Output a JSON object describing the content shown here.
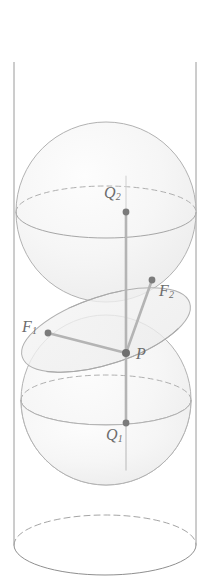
{
  "figure": {
    "type": "geometry-diagram",
    "width": 211,
    "height": 583,
    "background_color": "#ffffff",
    "stroke_color": "#9a9a9a",
    "sphere_fill": "#f4f4f4",
    "plane_fill": "#f0f0f0",
    "segment_color": "#a8a8a8",
    "point_color": "#7a7a7a",
    "label_color": "#6d6d6d"
  },
  "cylinder": {
    "left_x": 14,
    "right_x": 196,
    "top_ellipse": {
      "cx": 105,
      "cy": 62,
      "rx": 91,
      "ry": 32,
      "back_arc": "solid"
    },
    "bottom_ellipse": {
      "cx": 105,
      "cy": 545,
      "rx": 91,
      "ry": 30,
      "back_arc": "dashed"
    }
  },
  "spheres": [
    {
      "name": "upper-sphere",
      "cx": 106,
      "cy": 212,
      "r": 90,
      "equator": {
        "ry": 26,
        "back_arc": "dashed",
        "front_arc": "solid"
      }
    },
    {
      "name": "lower-sphere",
      "cx": 106,
      "cy": 400,
      "r": 85,
      "equator": {
        "ry": 25,
        "back_arc": "dashed",
        "front_arc": "solid"
      }
    }
  ],
  "cutting_plane": {
    "name": "tilted-plane-ellipse",
    "cx": 106,
    "cy": 330,
    "rx": 88,
    "ry": 34,
    "rotation_deg": -18
  },
  "points": [
    {
      "id": "Q2",
      "label": "Q",
      "sub": "2",
      "x": 126,
      "y": 212,
      "label_x": 104,
      "label_y": 184
    },
    {
      "id": "F2",
      "label": "F",
      "sub": "2",
      "x": 152,
      "y": 280,
      "label_x": 159,
      "label_y": 282
    },
    {
      "id": "F1",
      "label": "F",
      "sub": "1",
      "x": 48,
      "y": 333,
      "label_x": 22,
      "label_y": 318
    },
    {
      "id": "P",
      "label": "P",
      "sub": "",
      "x": 126,
      "y": 353,
      "label_x": 136,
      "label_y": 351
    },
    {
      "id": "Q1",
      "label": "Q",
      "sub": "1",
      "x": 126,
      "y": 423,
      "label_x": 106,
      "label_y": 424
    }
  ],
  "segments": [
    {
      "name": "segment-P-Q2",
      "from": "P",
      "to": "Q2"
    },
    {
      "name": "segment-P-Q1",
      "from": "P",
      "to": "Q1"
    },
    {
      "name": "segment-P-F1",
      "from": "P",
      "to": "F1"
    },
    {
      "name": "segment-P-F2",
      "from": "P",
      "to": "F2"
    }
  ],
  "labels": {
    "Q2": {
      "base": "Q",
      "subscript": "2"
    },
    "F2": {
      "base": "F",
      "subscript": "2"
    },
    "F1": {
      "base": "F",
      "subscript": "1"
    },
    "P": {
      "base": "P",
      "subscript": ""
    },
    "Q1": {
      "base": "Q",
      "subscript": "1"
    }
  }
}
